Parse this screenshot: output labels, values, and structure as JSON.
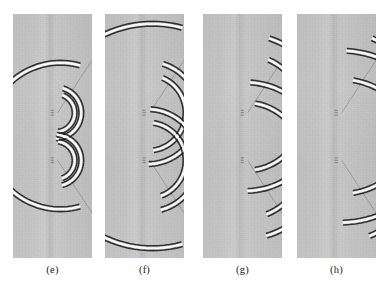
{
  "figure": {
    "type": "wavefield-snapshot-series",
    "background_color": "#c2c2c2",
    "wavefront_dark_color": "#1a1a1a",
    "wavefront_light_color": "#ffffff",
    "panel_count": 4,
    "panel_width_px": 79,
    "panel_height_px": 244,
    "panel_top_px": 14
  },
  "panels": [
    {
      "id": "e",
      "label": "(e)",
      "left_px": 13,
      "time_step": 1,
      "source_x": 0.6,
      "source_y": 0.42,
      "main_front_radius": 0.3,
      "scatterer_1_y": 0.405,
      "scatterer_2_y": 0.6,
      "diffraction_radius_1": 0.105,
      "diffraction_radius_2": 0.105,
      "notes": "Circular primary wavefront still closed inside the panel; small diffraction rings just emerging from both scatterers"
    },
    {
      "id": "f",
      "label": "(f)",
      "left_px": 105,
      "time_step": 2,
      "source_x": 0.6,
      "source_y": 0.42,
      "main_front_radius": 0.46,
      "scatterer_1_y": 0.405,
      "scatterer_2_y": 0.6,
      "diffraction_radius_1": 0.21,
      "diffraction_radius_2": 0.21,
      "notes": "Primary front has grown into a C shape clipped by the panel sides; diffraction arcs enlarged with straight tangent rays visible"
    },
    {
      "id": "g",
      "label": "(g)",
      "left_px": 203,
      "time_step": 3,
      "source_x": 0.6,
      "source_y": 0.42,
      "main_front_radius": 0.62,
      "scatterer_1_y": 0.405,
      "scatterer_2_y": 0.6,
      "diffraction_radius_1": 0.32,
      "diffraction_radius_2": 0.32,
      "notes": "Primary wavefront largely exited the left boundary leaving two arc segments top and bottom; diffraction fronts now dominate the right half"
    },
    {
      "id": "h",
      "label": "(h)",
      "left_px": 297,
      "time_step": 4,
      "source_x": 0.6,
      "source_y": 0.42,
      "main_front_radius": 0.8,
      "scatterer_1_y": 0.405,
      "scatterer_2_y": 0.6,
      "diffraction_radius_1": 0.45,
      "diffraction_radius_2": 0.45,
      "notes": "Latest snapshot; only upper and lower remnants of the primary front remain, diffraction fronts have expanded past the right boundary"
    }
  ]
}
